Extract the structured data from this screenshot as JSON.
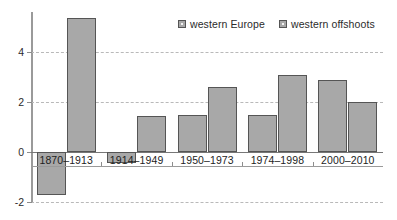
{
  "chart_data": {
    "type": "bar",
    "title": "",
    "subtitle": "",
    "xlabel": "",
    "ylabel": "",
    "categories": [
      "1870–1913",
      "1914–1949",
      "1950–1973",
      "1974–1998",
      "2000–2010"
    ],
    "series": [
      {
        "name": "western Europe",
        "values": [
          -1.7,
          -0.45,
          1.5,
          1.5,
          2.9
        ],
        "color": "#a8a8a8"
      },
      {
        "name": "western offshoots",
        "values": [
          5.35,
          1.45,
          2.6,
          3.1,
          2.0
        ],
        "color": "#a8a8a8"
      }
    ],
    "ylim": [
      -2,
      5.6
    ],
    "yticks": [
      4,
      2,
      0,
      -2
    ],
    "ytick_labels": [
      "4",
      "2",
      "0",
      "-2"
    ],
    "grid": true,
    "grid_style": "dashed-horizontal",
    "legend_position": "top-right",
    "zero_line": true
  },
  "legend": {
    "entries": [
      {
        "label": "western Europe",
        "swatch": "legend-swatch-western-europe"
      },
      {
        "label": "western offshoots",
        "swatch": "legend-swatch-western-offshoots"
      }
    ]
  },
  "axes": {
    "y": {
      "ticks": [
        {
          "value": 4,
          "label": "4"
        },
        {
          "value": 2,
          "label": "2"
        },
        {
          "value": 0,
          "label": "0"
        },
        {
          "value": -2,
          "label": "-2"
        }
      ]
    },
    "x": {
      "categories": [
        "1870–1913",
        "1914–1949",
        "1950–1973",
        "1974–1998",
        "2000–2010"
      ]
    }
  },
  "colors": {
    "bar_fill": "#a8a8a8",
    "bar_stroke": "#555555",
    "grid": "#b9b9b9",
    "axis": "#9a9a9a",
    "text": "#1d1d1d",
    "background": "#ffffff"
  }
}
